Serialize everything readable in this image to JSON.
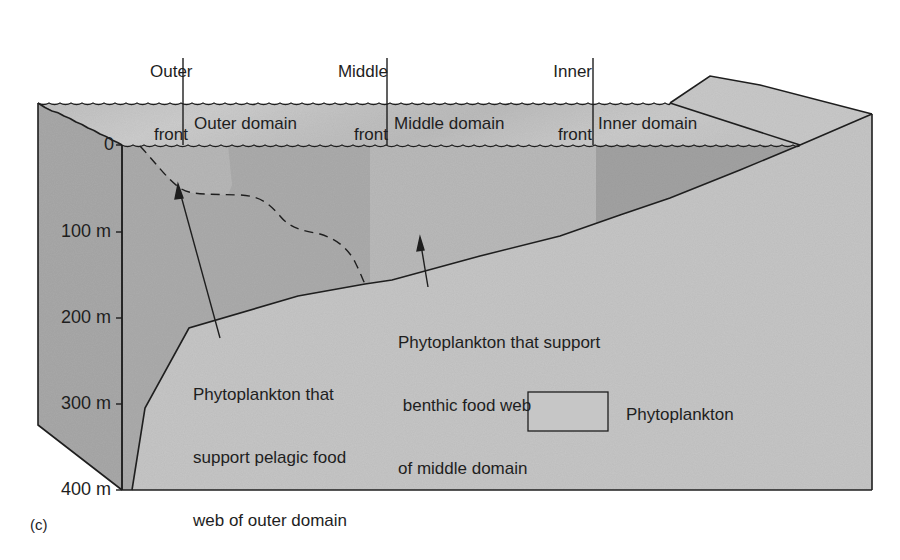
{
  "figure": {
    "panel_label": "(c)",
    "colors": {
      "background": "#ffffff",
      "left_side_face": "#a9a9a9",
      "surface_strip": "#c4c4c4",
      "surface_strip_light": "#d0d0d0",
      "outer_water": "#acacac",
      "outer_phyto": "#b7b7b7",
      "middle_water": "#b9b9b9",
      "inner_water": "#a3a3a3",
      "seafloor": "#c5c5c5",
      "land_top": "#c9c9c9",
      "line": "#1e1e1e"
    },
    "fronts": [
      {
        "line1": "Outer",
        "line2": "front"
      },
      {
        "line1": "Middle",
        "line2": "front"
      },
      {
        "line1": "Inner",
        "line2": "front"
      }
    ],
    "domains": [
      {
        "label": "Outer domain"
      },
      {
        "label": "Middle domain"
      },
      {
        "label": "Inner domain"
      }
    ],
    "depth_axis": {
      "ticks": [
        "0",
        "100 m",
        "200 m",
        "300 m",
        "400 m"
      ]
    },
    "callouts": {
      "pelagic": {
        "line1": "Phytoplankton that",
        "line2": "support pelagic food",
        "line3": "web of outer domain"
      },
      "benthic": {
        "line1": "Phytoplankton that support",
        "line2": " benthic food web",
        "line3": "of middle domain"
      }
    },
    "legend": {
      "label": "Phytoplankton"
    }
  }
}
